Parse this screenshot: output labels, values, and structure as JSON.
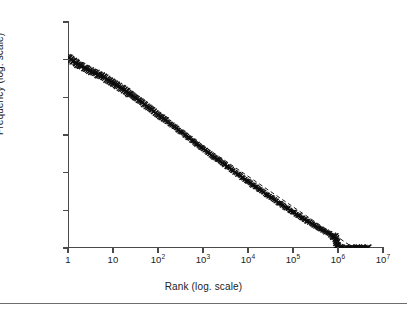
{
  "figure": {
    "background": "#ffffff",
    "marker_color": "#0d0d0d",
    "axis_color": "#4a4a4a",
    "fit_line_color": "#1a1a1a",
    "rule_color": "#6d6d6d"
  },
  "axes": {
    "x_title": "Rank (log. scale)",
    "y_title": "Frequency (log. scale)",
    "x_ticks": [
      {
        "label": "1",
        "exp": null,
        "value": 0
      },
      {
        "label": "10",
        "exp": null,
        "value": 1
      },
      {
        "label": "10",
        "exp": "2",
        "value": 2
      },
      {
        "label": "10",
        "exp": "3",
        "value": 3
      },
      {
        "label": "10",
        "exp": "4",
        "value": 4
      },
      {
        "label": "10",
        "exp": "5",
        "value": 5
      },
      {
        "label": "10",
        "exp": "6",
        "value": 6
      },
      {
        "label": "10",
        "exp": "7",
        "value": 7
      }
    ],
    "y_ticks": [
      {
        "label": "1",
        "exp": null,
        "value": 0
      },
      {
        "label": "10",
        "exp": null,
        "value": 1
      },
      {
        "label": "10",
        "exp": "2",
        "value": 2
      },
      {
        "label": "10",
        "exp": "3",
        "value": 3
      },
      {
        "label": "10",
        "exp": "4",
        "value": 4
      },
      {
        "label": "10",
        "exp": "5",
        "value": 5
      },
      {
        "label": "10",
        "exp": "6",
        "value": 6
      }
    ]
  },
  "chart_data": {
    "type": "scatter",
    "title": "",
    "subtitle": "",
    "xlabel": "Rank (log. scale)",
    "ylabel": "Frequency (log. scale)",
    "xscale": "log",
    "yscale": "log",
    "xlim": [
      1,
      10000000
    ],
    "ylim": [
      1,
      1000000
    ],
    "xlim_log10": [
      0,
      7
    ],
    "ylim_log10": [
      0,
      6
    ],
    "grid": false,
    "legend": null,
    "marker": "x",
    "annotations": [],
    "series": [
      {
        "name": "Rank-frequency distribution",
        "marker": "x",
        "color": "#0d0d0d",
        "description": "Dense Zipf-like rank-frequency cloud: starts near rank 1 at frequency 1e5 and decays approximately as a power law to frequency 1 at ranks above 1e6, where it saturates into a flat band extending to about 5e6.",
        "points_log10": [
          [
            0.0,
            5.08
          ],
          [
            0.1,
            4.97
          ],
          [
            0.2,
            4.9
          ],
          [
            0.3,
            4.83
          ],
          [
            0.4,
            4.77
          ],
          [
            0.5,
            4.71
          ],
          [
            0.6,
            4.65
          ],
          [
            0.7,
            4.59
          ],
          [
            0.78,
            4.54
          ],
          [
            0.85,
            4.49
          ],
          [
            0.92,
            4.44
          ],
          [
            1.0,
            4.38
          ],
          [
            1.08,
            4.32
          ],
          [
            1.15,
            4.27
          ],
          [
            1.22,
            4.21
          ],
          [
            1.3,
            4.15
          ],
          [
            1.38,
            4.09
          ],
          [
            1.46,
            4.02
          ],
          [
            1.54,
            3.95
          ],
          [
            1.62,
            3.88
          ],
          [
            1.7,
            3.81
          ],
          [
            1.8,
            3.72
          ],
          [
            1.9,
            3.63
          ],
          [
            2.0,
            3.54
          ],
          [
            2.1,
            3.45
          ],
          [
            2.2,
            3.36
          ],
          [
            2.3,
            3.27
          ],
          [
            2.4,
            3.18
          ],
          [
            2.5,
            3.09
          ],
          [
            2.6,
            3.0
          ],
          [
            2.7,
            2.91
          ],
          [
            2.8,
            2.82
          ],
          [
            2.9,
            2.73
          ],
          [
            3.0,
            2.64
          ],
          [
            3.1,
            2.55
          ],
          [
            3.2,
            2.46
          ],
          [
            3.3,
            2.37
          ],
          [
            3.4,
            2.29
          ],
          [
            3.5,
            2.2
          ],
          [
            3.6,
            2.11
          ],
          [
            3.7,
            2.02
          ],
          [
            3.8,
            1.94
          ],
          [
            3.9,
            1.85
          ],
          [
            4.0,
            1.77
          ],
          [
            4.1,
            1.68
          ],
          [
            4.2,
            1.6
          ],
          [
            4.3,
            1.52
          ],
          [
            4.4,
            1.43
          ],
          [
            4.5,
            1.35
          ],
          [
            4.6,
            1.27
          ],
          [
            4.7,
            1.19
          ],
          [
            4.8,
            1.11
          ],
          [
            4.9,
            1.03
          ],
          [
            5.0,
            0.95
          ],
          [
            5.1,
            0.88
          ],
          [
            5.2,
            0.8
          ],
          [
            5.3,
            0.73
          ],
          [
            5.4,
            0.66
          ],
          [
            5.5,
            0.59
          ],
          [
            5.6,
            0.52
          ],
          [
            5.7,
            0.45
          ],
          [
            5.8,
            0.39
          ],
          [
            5.85,
            0.34
          ],
          [
            5.9,
            0.3
          ],
          [
            5.95,
            0.3
          ],
          [
            6.0,
            0.0
          ],
          [
            6.1,
            0.0
          ],
          [
            6.2,
            0.0
          ],
          [
            6.3,
            0.0
          ],
          [
            6.4,
            0.0
          ],
          [
            6.5,
            0.0
          ],
          [
            6.6,
            0.0
          ],
          [
            6.68,
            0.0
          ]
        ]
      }
    ],
    "fit_line": {
      "name": "power-law reference",
      "style": "dashed",
      "color": "#1a1a1a",
      "endpoints_log10": [
        [
          0.0,
          5.15
        ],
        [
          6.35,
          0.0
        ]
      ],
      "slope_log10": -0.811
    }
  }
}
